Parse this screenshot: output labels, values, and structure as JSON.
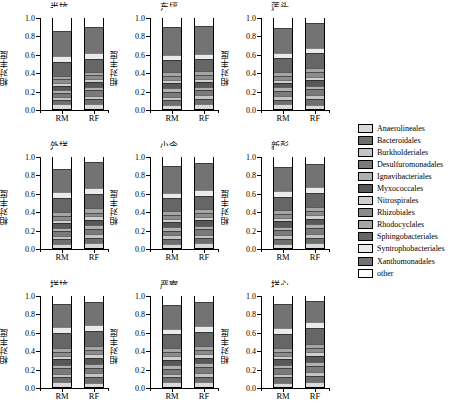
{
  "figure": {
    "ylabel": "相对丰度",
    "xlabels": [
      "RM",
      "RF"
    ],
    "yticks": [
      "0.0",
      "0.2",
      "0.4",
      "0.6",
      "0.8",
      "1.0"
    ],
    "ylim": [
      0,
      1
    ]
  },
  "legend": {
    "entries": [
      {
        "label": "Anaerolineales",
        "color": "#d9d9d9"
      },
      {
        "label": "Bacteroidales",
        "color": "#6e6e6e"
      },
      {
        "label": "Burkholderiales",
        "color": "#c4c4c4"
      },
      {
        "label": "Desulfuromonadales",
        "color": "#7a7a7a"
      },
      {
        "label": "Ignavibacteriales",
        "color": "#b0b0b0"
      },
      {
        "label": "Myxococcales",
        "color": "#585858"
      },
      {
        "label": "Nitrospirales",
        "color": "#cfcfcf"
      },
      {
        "label": "Rhizobiales",
        "color": "#8c8c8c"
      },
      {
        "label": "Rhodocyclales",
        "color": "#a5a5a5"
      },
      {
        "label": "Sphingobacteriales",
        "color": "#666666"
      },
      {
        "label": "Syntrophobacteriales",
        "color": "#ebebeb"
      },
      {
        "label": "Xanthomonadales",
        "color": "#737373"
      },
      {
        "label": "other",
        "color": "#ffffff"
      }
    ]
  },
  "chart_data": {
    "type": "bar",
    "title": "",
    "xlabel": "",
    "ylabel": "相对丰度",
    "ylim": [
      0,
      1
    ],
    "grid": false,
    "legend_position": "right",
    "stacked": true,
    "categories": [
      "RM",
      "RF"
    ],
    "taxa": [
      "Anaerolineales",
      "Bacteroidales",
      "Burkholderiales",
      "Desulfuromonadales",
      "Ignavibacteriales",
      "Myxococcales",
      "Nitrospirales",
      "Rhizobiales",
      "Rhodocyclales",
      "Sphingobacteriales",
      "Syntrophobacteriales",
      "Xanthomonadales",
      "other"
    ],
    "panels": [
      {
        "name": "半坑",
        "series": {
          "RM": [
            0.04,
            0.037,
            0.022,
            0.03,
            0.025,
            0.035,
            0.022,
            0.03,
            0.028,
            0.145,
            0.055,
            0.265,
            0.266
          ],
          "RF": [
            0.045,
            0.04,
            0.03,
            0.048,
            0.028,
            0.04,
            0.02,
            0.035,
            0.03,
            0.125,
            0.06,
            0.28,
            0.219
          ]
        }
      },
      {
        "name": "东坪",
        "series": {
          "RM": [
            0.035,
            0.045,
            0.025,
            0.04,
            0.03,
            0.05,
            0.025,
            0.03,
            0.035,
            0.12,
            0.04,
            0.305,
            0.22
          ],
          "RF": [
            0.04,
            0.05,
            0.028,
            0.045,
            0.03,
            0.045,
            0.022,
            0.032,
            0.033,
            0.115,
            0.045,
            0.3,
            0.215
          ]
        }
      },
      {
        "name": "莲头",
        "series": {
          "RM": [
            0.04,
            0.042,
            0.03,
            0.045,
            0.028,
            0.04,
            0.024,
            0.03,
            0.035,
            0.14,
            0.05,
            0.266,
            0.23
          ],
          "RF": [
            0.038,
            0.05,
            0.035,
            0.05,
            0.03,
            0.055,
            0.025,
            0.035,
            0.038,
            0.16,
            0.045,
            0.259,
            0.18
          ]
        }
      },
      {
        "name": "外垟",
        "series": {
          "RM": [
            0.038,
            0.04,
            0.025,
            0.042,
            0.026,
            0.045,
            0.022,
            0.03,
            0.032,
            0.15,
            0.05,
            0.25,
            0.25
          ],
          "RF": [
            0.042,
            0.048,
            0.03,
            0.05,
            0.03,
            0.05,
            0.024,
            0.032,
            0.034,
            0.145,
            0.055,
            0.28,
            0.18
          ]
        }
      },
      {
        "name": "小令",
        "series": {
          "RM": [
            0.036,
            0.044,
            0.028,
            0.042,
            0.028,
            0.048,
            0.023,
            0.031,
            0.033,
            0.13,
            0.047,
            0.29,
            0.22
          ],
          "RF": [
            0.04,
            0.046,
            0.03,
            0.046,
            0.03,
            0.05,
            0.024,
            0.032,
            0.035,
            0.14,
            0.05,
            0.287,
            0.19
          ]
        }
      },
      {
        "name": "新彭",
        "series": {
          "RM": [
            0.035,
            0.045,
            0.028,
            0.044,
            0.03,
            0.05,
            0.024,
            0.033,
            0.035,
            0.135,
            0.055,
            0.256,
            0.23
          ],
          "RF": [
            0.042,
            0.05,
            0.032,
            0.05,
            0.032,
            0.052,
            0.026,
            0.034,
            0.036,
            0.15,
            0.048,
            0.248,
            0.2
          ]
        }
      },
      {
        "name": "垟坑",
        "series": {
          "RM": [
            0.04,
            0.048,
            0.028,
            0.046,
            0.03,
            0.05,
            0.024,
            0.032,
            0.034,
            0.155,
            0.053,
            0.25,
            0.21
          ],
          "RF": [
            0.038,
            0.052,
            0.032,
            0.05,
            0.032,
            0.055,
            0.026,
            0.034,
            0.036,
            0.16,
            0.05,
            0.245,
            0.19
          ]
        }
      },
      {
        "name": "严寮",
        "series": {
          "RM": [
            0.04,
            0.046,
            0.03,
            0.044,
            0.03,
            0.048,
            0.025,
            0.033,
            0.035,
            0.145,
            0.052,
            0.252,
            0.22
          ],
          "RF": [
            0.044,
            0.05,
            0.032,
            0.048,
            0.032,
            0.052,
            0.026,
            0.035,
            0.037,
            0.15,
            0.054,
            0.25,
            0.19
          ]
        }
      },
      {
        "name": "垟心",
        "series": {
          "RM": [
            0.038,
            0.048,
            0.03,
            0.046,
            0.03,
            0.05,
            0.025,
            0.033,
            0.035,
            0.14,
            0.055,
            0.26,
            0.21
          ],
          "RF": [
            0.045,
            0.055,
            0.035,
            0.052,
            0.034,
            0.058,
            0.028,
            0.036,
            0.038,
            0.165,
            0.05,
            0.224,
            0.18
          ]
        }
      }
    ]
  }
}
